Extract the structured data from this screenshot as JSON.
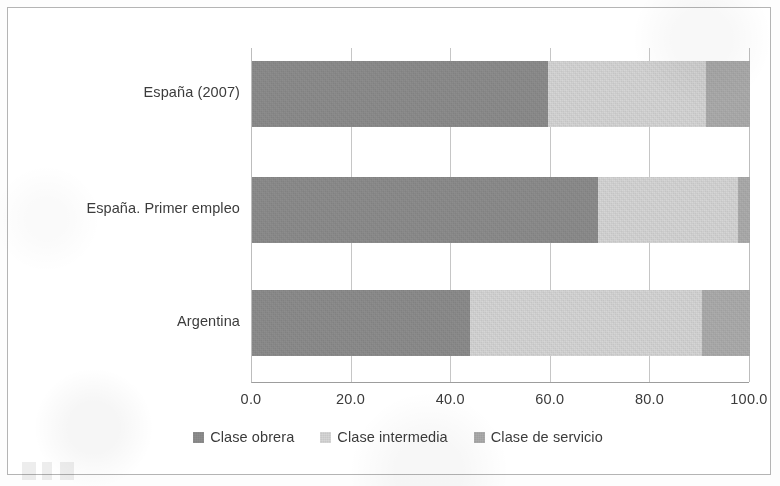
{
  "chart_data": {
    "type": "bar",
    "orientation": "horizontal",
    "stacked": true,
    "stack_mode": "percent",
    "title": "",
    "subtitle": "",
    "xlabel": "",
    "ylabel": "",
    "xlim": [
      0,
      100
    ],
    "xticks": [
      0,
      20,
      40,
      60,
      80,
      100
    ],
    "xtick_labels": [
      "0.0",
      "20.0",
      "40.0",
      "60.0",
      "80.0",
      "100.0"
    ],
    "grid": true,
    "grid_axis": "x",
    "legend_position": "bottom",
    "categories": [
      "España (2007)",
      "España. Primer empleo",
      "Argentina"
    ],
    "series": [
      {
        "name": "Clase obrera",
        "color": "#8d8d8d",
        "values": [
          59.4,
          69.5,
          43.8
        ]
      },
      {
        "name": "Clase intermedia",
        "color": "#d6d6d6",
        "values": [
          31.8,
          28.1,
          46.6
        ]
      },
      {
        "name": "Clase de servicio",
        "color": "#adadad",
        "values": [
          8.8,
          2.4,
          9.6
        ]
      }
    ],
    "cumulative_boundaries": [
      [
        59.4,
        91.2,
        100.0
      ],
      [
        69.5,
        97.6,
        100.0
      ],
      [
        43.8,
        90.4,
        100.0
      ]
    ]
  },
  "axis": {
    "ticks": [
      {
        "value": 0,
        "label": "0.0"
      },
      {
        "value": 20,
        "label": "20.0"
      },
      {
        "value": 40,
        "label": "40.0"
      },
      {
        "value": 60,
        "label": "60.0"
      },
      {
        "value": 80,
        "label": "80.0"
      },
      {
        "value": 100,
        "label": "100.0"
      }
    ]
  },
  "categories": [
    {
      "label": "España (2007)"
    },
    {
      "label": "España. Primer empleo"
    },
    {
      "label": "Argentina"
    }
  ],
  "legend": {
    "items": [
      {
        "label": "Clase obrera",
        "color": "#8d8d8d"
      },
      {
        "label": "Clase intermedia",
        "color": "#d6d6d6"
      },
      {
        "label": "Clase de servicio",
        "color": "#adadad"
      }
    ]
  },
  "colors": {
    "frame": "#b4b4b4",
    "gridline": "#c6c6c6",
    "axis_line": "#9d9d9d",
    "text": "#3b3b3b",
    "background": "#ffffff"
  }
}
